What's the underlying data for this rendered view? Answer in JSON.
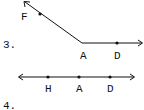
{
  "figures": [
    {
      "number": "3.",
      "description": "Angle formed by ray AF and ray AD",
      "points": [
        {
          "name": "F",
          "x": 40,
          "y": 14
        },
        {
          "name": "A",
          "x": 82,
          "y": 43
        },
        {
          "name": "D",
          "x": 117,
          "y": 43
        }
      ],
      "labels": {
        "F": "F",
        "A": "A",
        "D": "D"
      }
    },
    {
      "number": "4.",
      "description": "Line through points H, A, D",
      "points": [
        {
          "name": "H",
          "x": 48,
          "y": 77
        },
        {
          "name": "A",
          "x": 79,
          "y": 77
        },
        {
          "name": "D",
          "x": 110,
          "y": 77
        }
      ],
      "labels": {
        "H": "H",
        "A": "A",
        "D": "D"
      }
    }
  ],
  "colors": {
    "ink": "#111111",
    "background": "#ffffff"
  }
}
